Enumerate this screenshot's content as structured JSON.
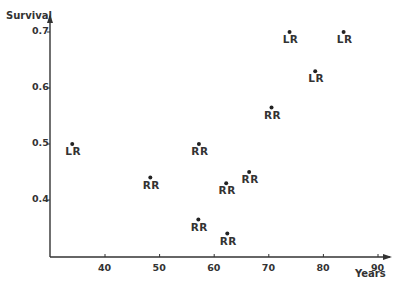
{
  "chart_data": {
    "type": "scatter",
    "title": "",
    "xlabel": "Years",
    "ylabel": "Survival",
    "xlim": [
      30,
      92
    ],
    "ylim": [
      0.3,
      0.72
    ],
    "x_ticks": [
      40,
      50,
      60,
      70,
      80,
      90
    ],
    "y_ticks": [
      0.4,
      0.5,
      0.6,
      0.7
    ],
    "x_tick_labels": [
      "40",
      "50",
      "60",
      "70",
      "80",
      "90"
    ],
    "y_tick_labels": [
      "0.4",
      "0.5",
      "0.6",
      "0.7"
    ],
    "grid": false,
    "legend": null,
    "points": [
      {
        "x": 34.0,
        "y": 0.5,
        "label": "LR"
      },
      {
        "x": 48.3,
        "y": 0.44,
        "label": "RR"
      },
      {
        "x": 57.2,
        "y": 0.5,
        "label": "RR"
      },
      {
        "x": 57.1,
        "y": 0.365,
        "label": "RR"
      },
      {
        "x": 62.2,
        "y": 0.43,
        "label": "RR"
      },
      {
        "x": 62.4,
        "y": 0.34,
        "label": "RR"
      },
      {
        "x": 66.4,
        "y": 0.45,
        "label": "RR"
      },
      {
        "x": 70.5,
        "y": 0.565,
        "label": "RR"
      },
      {
        "x": 73.8,
        "y": 0.7,
        "label": "LR"
      },
      {
        "x": 78.5,
        "y": 0.63,
        "label": "LR"
      },
      {
        "x": 83.7,
        "y": 0.7,
        "label": "LR"
      }
    ]
  },
  "colors": {
    "axis": "#333333",
    "point": "#222222",
    "text": "#333333",
    "background": "#ffffff"
  }
}
